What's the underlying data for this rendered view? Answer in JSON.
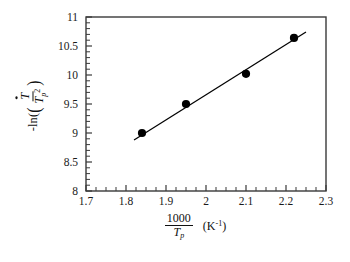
{
  "chart_data": {
    "type": "scatter",
    "title": "",
    "xlabel": "1000 / T_p  (K^-1)",
    "ylabel": "-ln( T_dot / T_p^2 )",
    "xlim": [
      1.7,
      2.3
    ],
    "ylim": [
      8,
      11
    ],
    "grid": false,
    "legend": null,
    "xticks": [
      "1.7",
      "1.8",
      "1.9",
      "2",
      "2.1",
      "2.2",
      "2.3"
    ],
    "xtick_values": [
      1.7,
      1.8,
      1.9,
      2.0,
      2.1,
      2.2,
      2.3
    ],
    "yticks": [
      "8",
      "8.5",
      "9",
      "9.5",
      "10",
      "10.5",
      "11"
    ],
    "ytick_values": [
      8,
      8.5,
      9,
      9.5,
      10,
      10.5,
      11
    ],
    "x": [
      1.84,
      1.95,
      2.1,
      2.22
    ],
    "y": [
      9.0,
      9.5,
      10.02,
      10.64
    ],
    "series": [
      {
        "name": "data points",
        "marker": "filled-circle",
        "color": "#000000",
        "x": [
          1.84,
          1.95,
          2.1,
          2.22
        ],
        "y": [
          9.0,
          9.5,
          10.02,
          10.64
        ]
      },
      {
        "name": "linear fit",
        "type": "line",
        "color": "#000000",
        "x": [
          1.82,
          2.25
        ],
        "y": [
          8.88,
          10.74
        ]
      }
    ],
    "axis_label_parts": {
      "y_prefix": "-ln(",
      "y_numerator": "T",
      "y_denominator": "T",
      "y_denominator_sub": "p",
      "y_denominator_sup": "2",
      "y_suffix": ")",
      "x_numerator": "1000",
      "x_denominator": "T",
      "x_denominator_sub": "p",
      "x_unit_open": "(K",
      "x_unit_sup": "-1",
      "x_unit_close": ")"
    },
    "style": {
      "axis_color": "#3a3a3a",
      "marker_color": "#000000",
      "line_color": "#000000",
      "background": "#ffffff"
    }
  }
}
